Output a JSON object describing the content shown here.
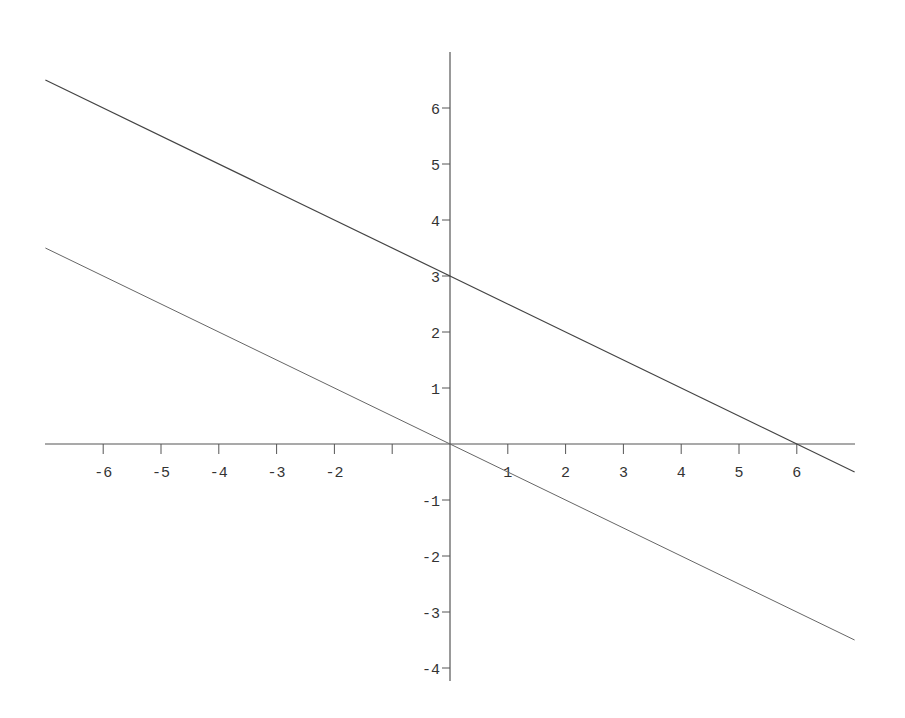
{
  "chart_data": {
    "type": "line",
    "title": "",
    "xlabel": "",
    "ylabel": "",
    "xlim": [
      -7,
      7
    ],
    "ylim": [
      -4,
      7
    ],
    "grid": false,
    "legend": null,
    "x_ticks": [
      -6,
      -5,
      -4,
      -3,
      -2,
      -1,
      1,
      2,
      3,
      4,
      5,
      6
    ],
    "x_tick_labels": [
      "-6",
      "-5",
      "-4",
      "-3",
      "-2",
      "",
      "1",
      "2",
      "3",
      "4",
      "5",
      "6"
    ],
    "y_ticks": [
      -4,
      -3,
      -2,
      -1,
      1,
      2,
      3,
      4,
      5,
      6
    ],
    "y_tick_labels": [
      "-4",
      "-3",
      "-2",
      "-1",
      "1",
      "2",
      "3",
      "4",
      "5",
      "6"
    ],
    "series": [
      {
        "name": "y = 3 - x/2",
        "x": [
          -7,
          7
        ],
        "y": [
          6.5,
          -0.5
        ],
        "color": "#444444"
      },
      {
        "name": "y = -x/2",
        "x": [
          -7,
          7
        ],
        "y": [
          3.5,
          -3.5
        ],
        "color": "#666666"
      }
    ],
    "annotations": []
  },
  "layout": {
    "origin_px": [
      450,
      444
    ],
    "x_unit_px": 57.8,
    "y_unit_px": 56,
    "x_axis_px_range": [
      45,
      855
    ],
    "y_axis_px_range": [
      52,
      681
    ]
  }
}
